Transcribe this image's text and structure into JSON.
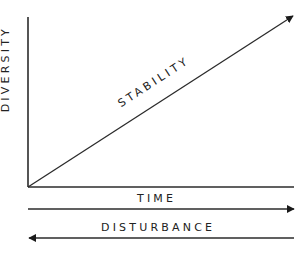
{
  "diagram": {
    "y_axis_label": "DIVERSITY",
    "x_axis_label": "TIME",
    "diagonal_label": "STABILITY",
    "bottom_arrow_label": "DISTURBANCE",
    "colors": {
      "stroke": "#2b2b2b",
      "text": "#222222",
      "background": "#ffffff"
    },
    "arrows": [
      {
        "name": "stability",
        "direction": "up-right",
        "from": [
          28,
          187
        ],
        "to": [
          293,
          15
        ]
      },
      {
        "name": "time",
        "direction": "right",
        "from": [
          28,
          209
        ],
        "to": [
          294,
          209
        ]
      },
      {
        "name": "disturbance",
        "direction": "left",
        "from": [
          294,
          238
        ],
        "to": [
          28,
          238
        ]
      }
    ]
  }
}
